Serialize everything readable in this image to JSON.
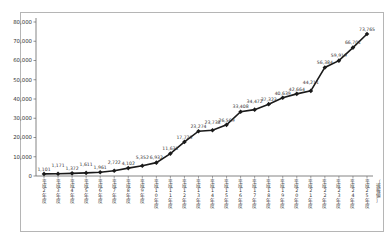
{
  "chart_data": {
    "type": "line",
    "title": "",
    "xlabel": "",
    "ylabel": "",
    "categories": [
      "平成2年度",
      "平成3年度",
      "平成4年度",
      "平成5年度",
      "平成6年度",
      "平成7年度",
      "平成8年度",
      "平成9年度",
      "平成10年度",
      "平成11年度",
      "平成12年度",
      "平成13年度",
      "平成14年度",
      "平成15年度",
      "平成16年度",
      "平成17年度",
      "平成18年度",
      "平成19年度",
      "平成20年度",
      "平成21年度",
      "平成22年度",
      "平成23年度",
      "平成24年度",
      "平成25年度"
    ],
    "values": [
      1101,
      1171,
      1372,
      1611,
      1961,
      2722,
      4102,
      5352,
      6932,
      11631,
      17725,
      23274,
      23738,
      26569,
      33408,
      34472,
      37323,
      40639,
      42664,
      44211,
      56384,
      59919,
      66701,
      73765
    ],
    "yticks": [
      0,
      10000,
      20000,
      30000,
      40000,
      50000,
      60000,
      70000,
      80000
    ],
    "ylim": [
      0,
      80000
    ],
    "annotation": "〔速報値〕",
    "legend": [],
    "grid": false,
    "colors": {
      "line": "#1a1a1a",
      "marker": "#1a1a1a",
      "label_text": "#333333",
      "axis": "#666666",
      "border": "#b5b5b5"
    }
  }
}
